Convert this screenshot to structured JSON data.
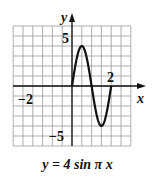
{
  "chart_data": {
    "type": "line",
    "title": "y = 4 sin π x",
    "xlabel": "x",
    "ylabel": "y",
    "xlim": [
      -3,
      3
    ],
    "ylim": [
      -6,
      6
    ],
    "x_grid_step": 0.5,
    "y_grid_step": 1,
    "grid": true,
    "x_tick_labels": [
      {
        "value": -2,
        "label": "−2"
      },
      {
        "value": 2,
        "label": "2"
      }
    ],
    "y_tick_labels": [
      {
        "value": 5,
        "label": "5"
      },
      {
        "value": -5,
        "label": "−5"
      }
    ],
    "series": [
      {
        "name": "y = 4 sin πx",
        "domain": [
          0,
          2
        ],
        "x": [
          0,
          0.25,
          0.5,
          0.75,
          1,
          1.25,
          1.5,
          1.75,
          2
        ],
        "values": [
          0,
          2.83,
          4,
          2.83,
          0,
          -2.83,
          -4,
          -2.83,
          0
        ]
      }
    ]
  },
  "labels": {
    "x_axis": "x",
    "y_axis": "y",
    "tick_neg2": "−2",
    "tick_2": "2",
    "tick_5": "5",
    "tick_neg5": "−5",
    "caption": "y = 4 sin π x"
  }
}
